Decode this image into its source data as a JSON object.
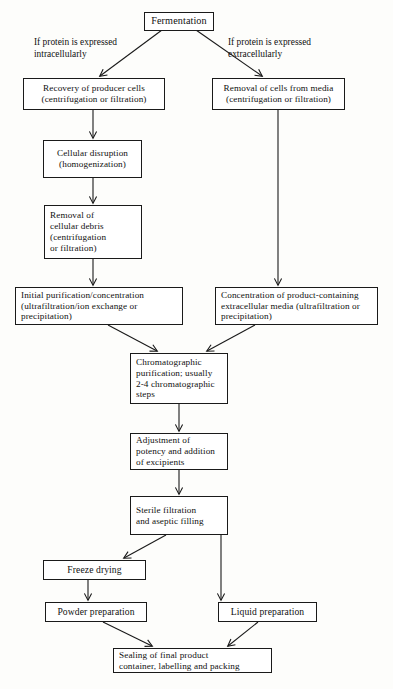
{
  "diagram": {
    "stroke_color": "#1a1a1a",
    "background_color": "#fdfdfb",
    "nodes": {
      "fermentation": "Fermentation",
      "recovery_producer_cells": "Recovery of producer cells\n(centrifugation or filtration)",
      "removal_cells_media": "Removal of cells from media\n(centrifugation or filtration)",
      "cellular_disruption": "Cellular disruption\n(homogenization)",
      "removal_cellular_debris": "Removal of\ncellular debris\n(centrifugation\nor filtration)",
      "initial_purification": "Initial purification/concentration\n(ultrafiltration/ion exchange or\nprecipitation)",
      "concentration_extracellular": "Concentration of product-containing\nextracellular media (ultrafiltration or\nprecipitation)",
      "chromatographic_purification": "Chromatographic\npurification; usually\n2-4 chromatographic\nsteps",
      "adjustment_potency": "Adjustment of\npotency and addition\nof excipients",
      "sterile_filtration": "Sterile filtration\nand aseptic filling",
      "freeze_drying": "Freeze drying",
      "powder_preparation": "Powder preparation",
      "liquid_preparation": "Liquid preparation",
      "sealing_final_product": "Sealing of final product\ncontainer, labelling and packing"
    },
    "edge_labels": {
      "intracellular": "If protein is expressed\nintracellularly",
      "extracellular": "If protein is expressed\nextracellularly"
    }
  }
}
